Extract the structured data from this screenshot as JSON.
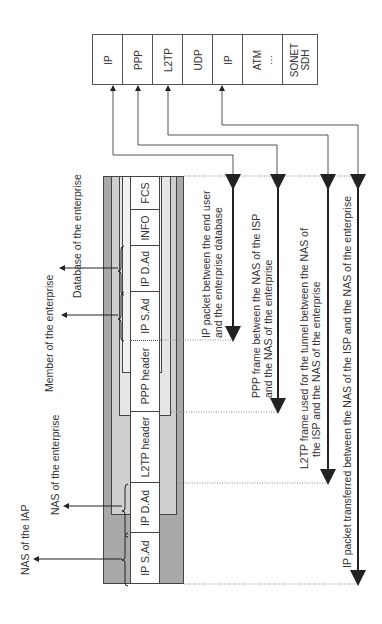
{
  "protocol_stack": {
    "cells": [
      {
        "label": "IP"
      },
      {
        "label": "PPP"
      },
      {
        "label": "L2TP"
      },
      {
        "label": "UDP"
      },
      {
        "label": "IP"
      },
      {
        "label": "ATM\n…"
      },
      {
        "label": "SONET\nSDH"
      }
    ]
  },
  "frame": {
    "outer_ip": {
      "src": "IP S.Ad",
      "dst": "IP D.Ad"
    },
    "l2tp_header": "L2TP header",
    "ppp_header": "PPP header",
    "inner_ip": {
      "src": "IP S.Ad",
      "dst": "IP D.Ad"
    },
    "info": "INFO",
    "fcs": "FCS"
  },
  "left_labels": {
    "nas_iap": "NAS of the IAP",
    "nas_enterprise": "NAS of the enterprise",
    "member_enterprise": "Member of the enterprise",
    "database_enterprise": "Database of the enterprise"
  },
  "right_labels": {
    "ip_packet": [
      "IP packet between the end user",
      "and the enterprise database"
    ],
    "ppp_frame": [
      "PPP frame between the NAS of the ISP",
      "and the NAS of the enterprise"
    ],
    "l2tp_frame": [
      "L2TP frame used for the tunnel between the NAS of",
      "the ISP and the NAS of the enterprise"
    ],
    "outer_ip_packet": [
      "IP packet transferred between the NAS of the ISP and the NAS of the enterprise"
    ]
  },
  "colors": {
    "outer_band": "#a9a9a9",
    "mid_band": "#cfcfcf",
    "inner_band": "#e6e6e6",
    "line": "#555555"
  }
}
